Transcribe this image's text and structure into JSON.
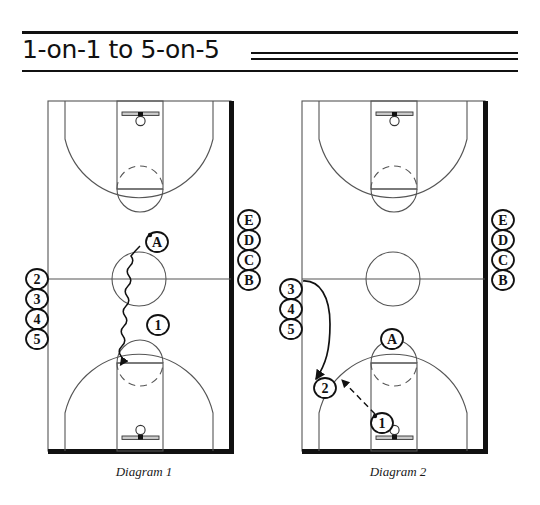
{
  "page": {
    "title": "1-on-1 to 5-on-5",
    "background_color": "#ffffff",
    "ink_color": "#111111"
  },
  "diagrams": [
    {
      "id": "diagram-1",
      "caption": "Diagram 1",
      "court": {
        "orientation": "full-court-vertical",
        "has_top_basket": true,
        "has_bottom_basket": true,
        "midcourt_line": true,
        "center_circle": true,
        "thick_sideline": "right",
        "thick_baseline": "bottom"
      },
      "queue_left": {
        "label": "offense-queue",
        "players": [
          "2",
          "3",
          "4",
          "5"
        ]
      },
      "queue_right": {
        "label": "defense-queue",
        "players": [
          "E",
          "D",
          "C",
          "B"
        ]
      },
      "players_on_court": [
        {
          "label": "A",
          "role": "defender",
          "shape": "circle"
        },
        {
          "label": "1",
          "role": "offense",
          "shape": "circle"
        }
      ],
      "movements": [
        {
          "type": "dribble",
          "from": "A",
          "direction": "down",
          "style": "squiggle-with-arrow"
        }
      ]
    },
    {
      "id": "diagram-2",
      "caption": "Diagram 2",
      "court": {
        "orientation": "full-court-vertical",
        "has_top_basket": true,
        "has_bottom_basket": true,
        "midcourt_line": true,
        "center_circle": true,
        "thick_sideline": "right",
        "thick_baseline": "bottom"
      },
      "queue_left": {
        "label": "offense-queue",
        "players": [
          "3",
          "4",
          "5"
        ]
      },
      "queue_right": {
        "label": "defense-queue",
        "players": [
          "E",
          "D",
          "C",
          "B"
        ]
      },
      "players_on_court": [
        {
          "label": "A",
          "role": "defender",
          "shape": "circle"
        },
        {
          "label": "2",
          "role": "offense",
          "shape": "circle"
        },
        {
          "label": "1",
          "role": "offense",
          "shape": "circle"
        }
      ],
      "movements": [
        {
          "type": "cut",
          "from": "3",
          "to": "2",
          "style": "curved-arrow"
        },
        {
          "type": "pass",
          "from": "1",
          "to": "2",
          "style": "dashed-arrow"
        }
      ]
    }
  ]
}
